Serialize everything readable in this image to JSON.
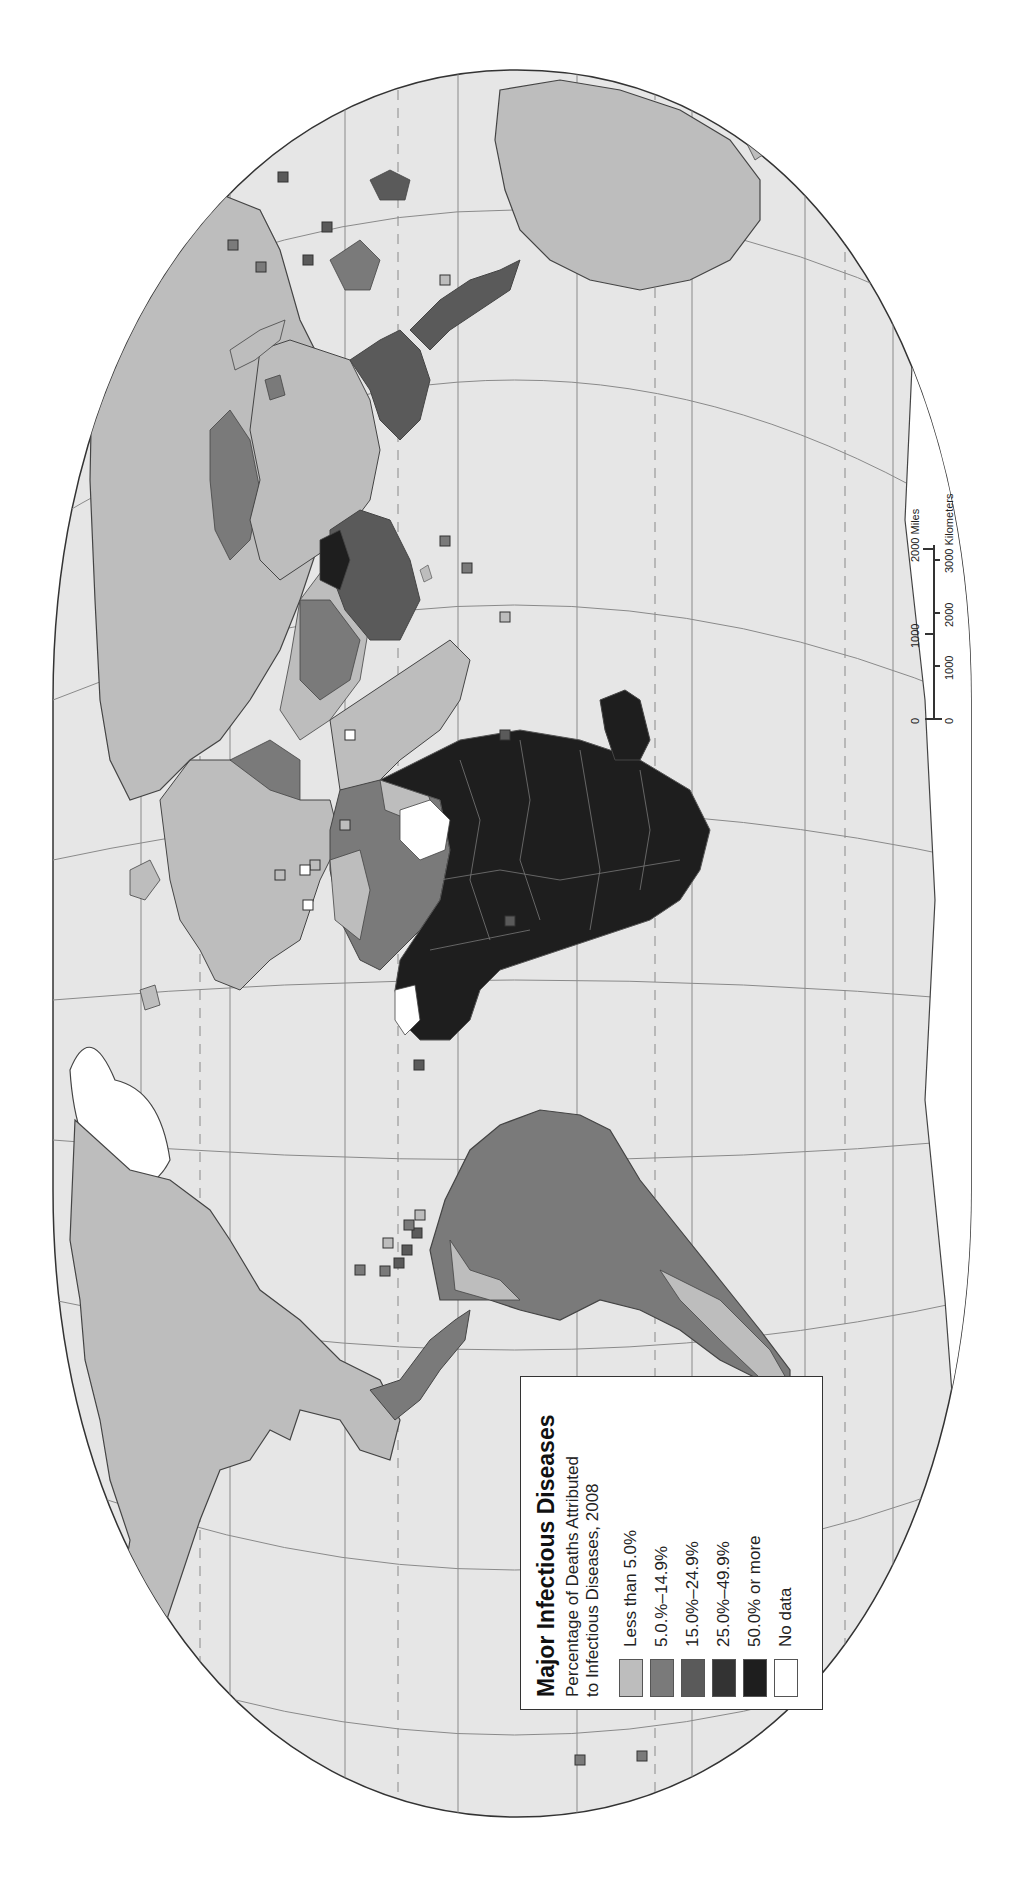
{
  "map": {
    "title": "Major Infectious Diseases",
    "subtitle_line1": "Percentage of Deaths Attributed",
    "subtitle_line2": "to Infectious Diseases, 2008",
    "orientation": "rotated 90 degrees counter-clockwise",
    "background_ocean": "#e6e6e6",
    "graticule_color": "#8a8a8a"
  },
  "legend": {
    "items": [
      {
        "label": "Less than 5.0%",
        "color": "#bdbdbd"
      },
      {
        "label": "5.0.%–14.9%",
        "color": "#7a7a7a"
      },
      {
        "label": "15.0%–24.9%",
        "color": "#5a5a5a"
      },
      {
        "label": "25.0%–49.9%",
        "color": "#333333"
      },
      {
        "label": "50.0% or more",
        "color": "#1e1e1e"
      },
      {
        "label": "No data",
        "color": "#ffffff"
      }
    ]
  },
  "scale_bar": {
    "miles": {
      "ticks": [
        "0",
        "1000",
        "2000"
      ],
      "unit": "2000 Miles"
    },
    "kilometers": {
      "ticks": [
        "0",
        "1000",
        "2000",
        "3000"
      ],
      "unit": "3000 Kilometers"
    }
  },
  "regions": [
    {
      "name": "North America (US/Canada)",
      "class": "Less than 5.0%"
    },
    {
      "name": "Mexico/Central America",
      "class": "Less than 5.0%"
    },
    {
      "name": "South America (most)",
      "class": "5.0.%–14.9%"
    },
    {
      "name": "Sub-Saharan Africa",
      "class": "50.0% or more"
    },
    {
      "name": "North Africa",
      "class": "5.0.%–14.9%"
    },
    {
      "name": "Europe",
      "class": "Less than 5.0%"
    },
    {
      "name": "Russia",
      "class": "Less than 5.0%"
    },
    {
      "name": "China",
      "class": "Less than 5.0%"
    },
    {
      "name": "South Asia",
      "class": "15.0%–24.9%"
    },
    {
      "name": "Southeast Asia",
      "class": "15.0%–24.9%"
    },
    {
      "name": "Australia",
      "class": "Less than 5.0%"
    },
    {
      "name": "Greenland / Antarctica",
      "class": "No data"
    }
  ]
}
